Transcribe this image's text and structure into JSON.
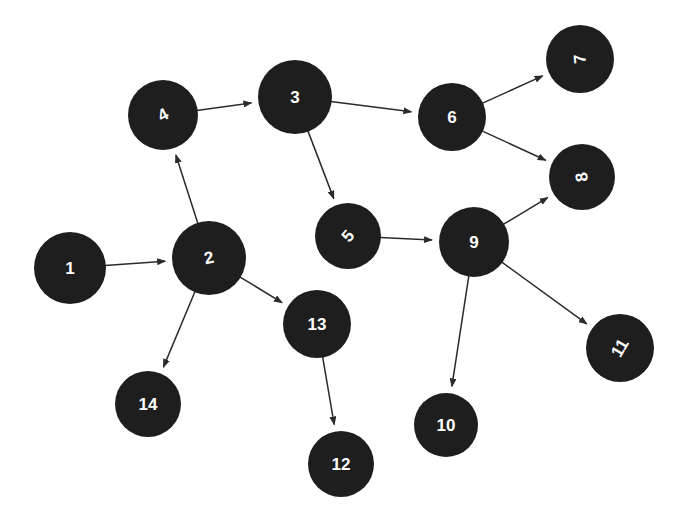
{
  "diagram": {
    "type": "directed-graph",
    "title": "",
    "background_color": "#ffffff",
    "node_color": "#1e1e1e",
    "node_label_color": "#ffffff",
    "edge_color": "#2b2b2b",
    "node_count": 14,
    "edge_count": 13,
    "nodes": [
      {
        "id": "1",
        "label": "1",
        "cx": 70,
        "cy": 268,
        "r": 36,
        "rotation": 0,
        "font_size": 17
      },
      {
        "id": "2",
        "label": "2",
        "cx": 209,
        "cy": 258,
        "r": 37,
        "rotation": -12,
        "font_size": 17
      },
      {
        "id": "3",
        "label": "3",
        "cx": 295,
        "cy": 97,
        "r": 37,
        "rotation": 0,
        "font_size": 17
      },
      {
        "id": "4",
        "label": "4",
        "cx": 163,
        "cy": 115,
        "r": 35,
        "rotation": -28,
        "font_size": 17
      },
      {
        "id": "5",
        "label": "5",
        "cx": 348,
        "cy": 236,
        "r": 33,
        "rotation": -50,
        "font_size": 17
      },
      {
        "id": "6",
        "label": "6",
        "cx": 452,
        "cy": 117,
        "r": 34,
        "rotation": 0,
        "font_size": 17
      },
      {
        "id": "7",
        "label": "7",
        "cx": 580,
        "cy": 59,
        "r": 34,
        "rotation": -95,
        "font_size": 17
      },
      {
        "id": "8",
        "label": "8",
        "cx": 582,
        "cy": 177,
        "r": 33,
        "rotation": -98,
        "font_size": 17
      },
      {
        "id": "9",
        "label": "9",
        "cx": 474,
        "cy": 242,
        "r": 35,
        "rotation": 0,
        "font_size": 17
      },
      {
        "id": "10",
        "label": "10",
        "cx": 446,
        "cy": 425,
        "r": 32,
        "rotation": 0,
        "font_size": 17
      },
      {
        "id": "11",
        "label": "11",
        "cx": 620,
        "cy": 348,
        "r": 34,
        "rotation": -60,
        "font_size": 17
      },
      {
        "id": "12",
        "label": "12",
        "cx": 341,
        "cy": 464,
        "r": 33,
        "rotation": 0,
        "font_size": 17
      },
      {
        "id": "13",
        "label": "13",
        "cx": 317,
        "cy": 324,
        "r": 34,
        "rotation": 0,
        "font_size": 17
      },
      {
        "id": "14",
        "label": "14",
        "cx": 148,
        "cy": 404,
        "r": 33,
        "rotation": 0,
        "font_size": 17
      }
    ],
    "edges": [
      {
        "from": "1",
        "to": "2",
        "directed": true
      },
      {
        "from": "2",
        "to": "4",
        "directed": true
      },
      {
        "from": "2",
        "to": "13",
        "directed": true
      },
      {
        "from": "2",
        "to": "14",
        "directed": true
      },
      {
        "from": "4",
        "to": "3",
        "directed": true
      },
      {
        "from": "3",
        "to": "6",
        "directed": true
      },
      {
        "from": "3",
        "to": "5",
        "directed": true
      },
      {
        "from": "5",
        "to": "9",
        "directed": true
      },
      {
        "from": "6",
        "to": "7",
        "directed": true
      },
      {
        "from": "6",
        "to": "8",
        "directed": true
      },
      {
        "from": "9",
        "to": "8",
        "directed": true
      },
      {
        "from": "9",
        "to": "10",
        "directed": true
      },
      {
        "from": "9",
        "to": "11",
        "directed": true
      },
      {
        "from": "13",
        "to": "12",
        "directed": true
      }
    ]
  }
}
